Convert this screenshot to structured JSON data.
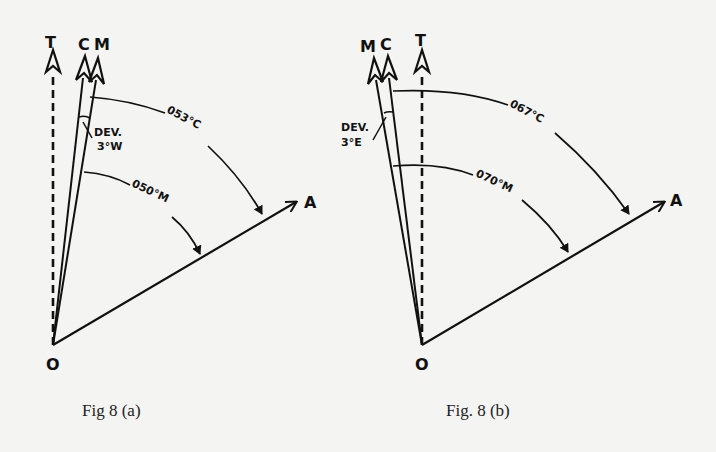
{
  "figures": [
    {
      "id": "a",
      "caption": "Fig 8 (a)",
      "labels": {
        "true_north": "T",
        "compass_north": "C",
        "magnetic_north": "M",
        "origin": "O",
        "target": "A",
        "deviation_line1": "DEV.",
        "deviation_line2": "3°W",
        "compass_bearing": "053°C",
        "magnetic_bearing": "050°M"
      }
    },
    {
      "id": "b",
      "caption": "Fig. 8 (b)",
      "labels": {
        "true_north": "T",
        "compass_north": "C",
        "magnetic_north": "M",
        "origin": "O",
        "target": "A",
        "deviation_line1": "DEV.",
        "deviation_line2": "3°E",
        "compass_bearing": "067°C",
        "magnetic_bearing": "070°M"
      }
    }
  ],
  "colors": {
    "ink": "#111111",
    "paper": "#f4f4f2"
  }
}
